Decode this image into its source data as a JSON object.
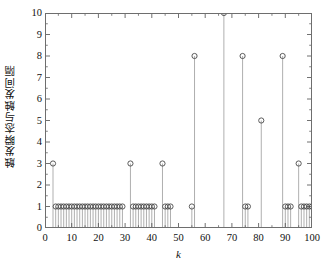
{
  "chart_data": {
    "type": "scatter",
    "plot_style": "stem",
    "title": "",
    "xlabel": "k",
    "ylabel": "触发瞬态与触发间隔",
    "xlim": [
      0,
      100
    ],
    "ylim": [
      0,
      10
    ],
    "xticks": [
      0,
      10,
      20,
      30,
      40,
      50,
      60,
      70,
      80,
      90,
      100
    ],
    "yticks": [
      0,
      1,
      2,
      3,
      4,
      5,
      6,
      7,
      8,
      9,
      10
    ],
    "xtick_labels": [
      "0",
      "10",
      "20",
      "30",
      "40",
      "50",
      "60",
      "70",
      "80",
      "90",
      "100"
    ],
    "ytick_labels": [
      "0",
      "1",
      "2",
      "3",
      "4",
      "5",
      "6",
      "7",
      "8",
      "9",
      "10"
    ],
    "grid": false,
    "legend": null,
    "marker": "open-circle",
    "marker_color": "#4a4a4a",
    "stem_color": "#8c8c8c",
    "baseline": 0,
    "x": [
      3,
      4,
      5,
      6,
      7,
      8,
      9,
      10,
      11,
      12,
      13,
      14,
      15,
      16,
      17,
      18,
      19,
      20,
      21,
      22,
      23,
      24,
      25,
      26,
      27,
      28,
      29,
      32,
      33,
      34,
      35,
      36,
      37,
      38,
      39,
      40,
      41,
      44,
      45,
      46,
      47,
      55,
      56,
      74,
      75,
      76,
      81,
      89,
      90,
      91,
      92,
      95,
      96,
      97,
      98,
      99,
      100
    ],
    "y": [
      3,
      1,
      1,
      1,
      1,
      1,
      1,
      1,
      1,
      1,
      1,
      1,
      1,
      1,
      1,
      1,
      1,
      1,
      1,
      1,
      1,
      1,
      1,
      1,
      1,
      1,
      1,
      3,
      1,
      1,
      1,
      1,
      1,
      1,
      1,
      1,
      1,
      3,
      1,
      1,
      1,
      1,
      8,
      8,
      1,
      1,
      5,
      8,
      1,
      1,
      1,
      3,
      1,
      1,
      1,
      1,
      1
    ],
    "annotations": [
      {
        "x": 3,
        "y": 3,
        "note": "spike"
      },
      {
        "x": 32,
        "y": 3,
        "note": "spike"
      },
      {
        "x": 44,
        "y": 3,
        "note": "spike"
      },
      {
        "x": 56,
        "y": 8,
        "note": "spike"
      },
      {
        "x": 67,
        "y": 10,
        "note": "max spike"
      },
      {
        "x": 74,
        "y": 8,
        "note": "spike"
      },
      {
        "x": 81,
        "y": 5,
        "note": "spike"
      },
      {
        "x": 89,
        "y": 8,
        "note": "spike"
      },
      {
        "x": 95,
        "y": 3,
        "note": "spike"
      }
    ],
    "extra_points": [
      {
        "x": 67,
        "y": 10
      }
    ]
  }
}
